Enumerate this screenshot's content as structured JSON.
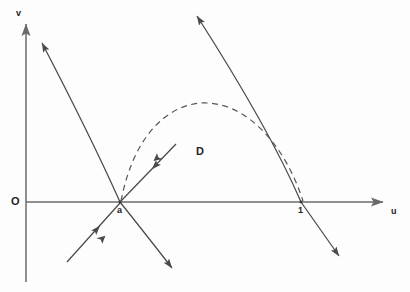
{
  "figure": {
    "type": "phase-plane-diagram",
    "background_color": "#fdfdfd",
    "stroke_color": "#4a4a4a",
    "axis_color": "#6a6a6a",
    "text_color": "#222222",
    "width": 410,
    "height": 292
  },
  "axes": {
    "horizontal": {
      "label": "u",
      "label_x": 393,
      "label_y": 212,
      "y": 202,
      "x_start": 26,
      "x_end": 385,
      "arrow": "right"
    },
    "vertical": {
      "label": "v",
      "label_x": 16,
      "label_y": 14,
      "x": 26,
      "y_start": 282,
      "y_end": 22,
      "arrow": "up"
    },
    "origin": {
      "label": "O",
      "label_x": 12,
      "label_y": 198
    }
  },
  "points": [
    {
      "id": "a",
      "label": "a",
      "x": 120,
      "y": 202,
      "label_x": 118,
      "label_y": 208
    },
    {
      "id": "one",
      "label": "1",
      "x": 301,
      "y": 202,
      "label_x": 298,
      "label_y": 208
    }
  ],
  "regions": [
    {
      "id": "D",
      "label": "D",
      "label_x": 196,
      "label_y": 147
    }
  ],
  "curves": [
    {
      "name": "separatrix-upper-left",
      "style": "solid",
      "path": "M 120 202 Q 90 135 42 43",
      "arrow_at": "end"
    },
    {
      "name": "separatrix-lower-right",
      "style": "solid",
      "path": "M 120 202 Q 144 232 172 268",
      "arrow_at": "end"
    },
    {
      "name": "separatrix-lower-left-inflow",
      "style": "solid",
      "path": "M 67 262 L 120 203",
      "arrow_at": "mid"
    },
    {
      "name": "separatrix-inflow-into-a",
      "style": "solid",
      "path": "M 176 144 L 121 201",
      "arrow_at": "mid"
    },
    {
      "name": "separatrix-through-one-upper",
      "style": "solid",
      "path": "M 301 202 Q 270 130 197 16",
      "arrow_at": "end"
    },
    {
      "name": "separatrix-through-one-lower",
      "style": "solid",
      "path": "M 301 202 L 339 256",
      "arrow_at": "end"
    },
    {
      "name": "heteroclinic-orbit-boundary",
      "style": "dashed",
      "path": "M 121 201 C 135 128 175 101 208 103 C 248 105 285 145 303 201",
      "arrow_at": "none"
    }
  ]
}
